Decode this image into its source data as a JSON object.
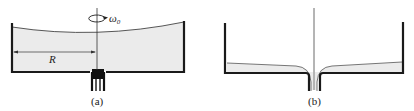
{
  "panels": [
    {
      "id": "a",
      "caption": "(a)",
      "radius_label": "R",
      "omega_label": "ω",
      "omega_subscript": "0",
      "description": "Rotating cylindrical tank filled with liquid, curved free surface, drain at bottom center"
    },
    {
      "id": "b",
      "caption": "(b)",
      "description": "Same tank nearly drained, thin liquid layer flowing into central drain"
    }
  ],
  "colors": {
    "wall": "#1a1a1a",
    "liquid": "#ebebeb",
    "axis": "#333333"
  }
}
